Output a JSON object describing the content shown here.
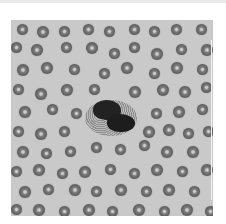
{
  "image": {
    "subject": "peripheral blood smear micrograph",
    "description": "grayscale microscope field of red blood cells surrounding a single dark granulated white blood cell",
    "colors": {
      "background": "#c9c9c9",
      "rbc": "#606060",
      "rbc_center": "#cfcfcf",
      "nucleus": "#222222",
      "border": "#ffffff"
    },
    "rbcs": [
      [
        6,
        4,
        11
      ],
      [
        26,
        6,
        12
      ],
      [
        48,
        6,
        11
      ],
      [
        72,
        4,
        11
      ],
      [
        93,
        6,
        11
      ],
      [
        118,
        4,
        11
      ],
      [
        138,
        6,
        11
      ],
      [
        160,
        4,
        11
      ],
      [
        185,
        4,
        11
      ],
      [
        0,
        22,
        11
      ],
      [
        20,
        24,
        12
      ],
      [
        50,
        22,
        11
      ],
      [
        75,
        22,
        12
      ],
      [
        98,
        28,
        11
      ],
      [
        118,
        22,
        11
      ],
      [
        140,
        28,
        12
      ],
      [
        165,
        24,
        11
      ],
      [
        190,
        24,
        12
      ],
      [
        6,
        44,
        12
      ],
      [
        30,
        42,
        12
      ],
      [
        58,
        44,
        11
      ],
      [
        88,
        48,
        11
      ],
      [
        110,
        42,
        12
      ],
      [
        138,
        48,
        11
      ],
      [
        160,
        42,
        12
      ],
      [
        186,
        44,
        11
      ],
      [
        2,
        64,
        11
      ],
      [
        24,
        68,
        12
      ],
      [
        50,
        64,
        12
      ],
      [
        78,
        64,
        11
      ],
      [
        118,
        66,
        12
      ],
      [
        146,
        64,
        12
      ],
      [
        168,
        66,
        12
      ],
      [
        190,
        62,
        11
      ],
      [
        8,
        86,
        12
      ],
      [
        36,
        84,
        11
      ],
      [
        60,
        88,
        11
      ],
      [
        140,
        88,
        11
      ],
      [
        162,
        86,
        12
      ],
      [
        186,
        84,
        11
      ],
      [
        2,
        106,
        11
      ],
      [
        24,
        108,
        12
      ],
      [
        48,
        106,
        11
      ],
      [
        132,
        106,
        12
      ],
      [
        152,
        104,
        12
      ],
      [
        172,
        108,
        11
      ],
      [
        192,
        106,
        11
      ],
      [
        6,
        126,
        12
      ],
      [
        30,
        128,
        11
      ],
      [
        54,
        126,
        11
      ],
      [
        80,
        122,
        11
      ],
      [
        104,
        124,
        11
      ],
      [
        128,
        120,
        11
      ],
      [
        150,
        126,
        12
      ],
      [
        176,
        126,
        12
      ],
      [
        0,
        146,
        11
      ],
      [
        22,
        144,
        12
      ],
      [
        46,
        148,
        11
      ],
      [
        68,
        146,
        12
      ],
      [
        94,
        144,
        11
      ],
      [
        118,
        148,
        11
      ],
      [
        140,
        144,
        12
      ],
      [
        166,
        146,
        11
      ],
      [
        190,
        144,
        12
      ],
      [
        8,
        166,
        12
      ],
      [
        32,
        164,
        11
      ],
      [
        58,
        164,
        12
      ],
      [
        80,
        166,
        11
      ],
      [
        104,
        164,
        12
      ],
      [
        130,
        166,
        11
      ],
      [
        152,
        164,
        12
      ],
      [
        178,
        166,
        11
      ],
      [
        0,
        184,
        11
      ],
      [
        22,
        184,
        12
      ],
      [
        48,
        186,
        11
      ],
      [
        72,
        184,
        12
      ],
      [
        96,
        186,
        11
      ],
      [
        122,
        184,
        12
      ],
      [
        148,
        186,
        11
      ],
      [
        170,
        184,
        12
      ],
      [
        194,
        186,
        11
      ]
    ]
  }
}
